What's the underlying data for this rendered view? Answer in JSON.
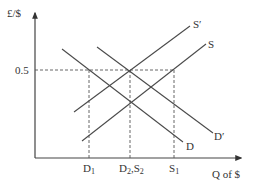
{
  "diagram": {
    "y_axis_label": "£/$",
    "x_axis_label": "Q of $",
    "price_tick": "0.5",
    "curves": [
      {
        "id": "D",
        "label": "D",
        "type": "demand"
      },
      {
        "id": "D_prime",
        "label": "D′",
        "type": "demand"
      },
      {
        "id": "S",
        "label": "S",
        "type": "supply"
      },
      {
        "id": "S_prime",
        "label": "S′",
        "type": "supply"
      }
    ],
    "quantity_labels": {
      "q1": "D",
      "q1_sub": "1",
      "q2a": "D",
      "q2a_sub": "2",
      "q2_sep": ",",
      "q2b": "S",
      "q2b_sub": "2",
      "q3": "S",
      "q3_sub": "1"
    },
    "colors": {
      "line": "#4a4a4a",
      "text": "#333333",
      "background": "#ffffff"
    }
  }
}
